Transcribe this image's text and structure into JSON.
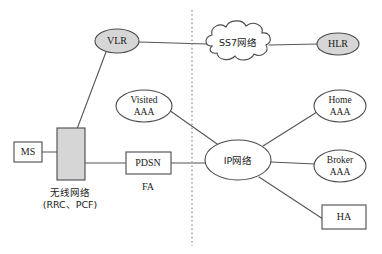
{
  "diagram": {
    "divider": {
      "name": "vertical-dotted-divider",
      "x": 192,
      "y1": 10,
      "y2": 246
    },
    "colors": {
      "gray_fill": "#d6d6d6",
      "white_fill": "#ffffff",
      "outline": "#4a4a50",
      "edge": "#55555a",
      "divider": "#a8a8ac",
      "text": "#1a1a1a",
      "background": "#ffffff"
    },
    "nodes": [
      {
        "id": "vlr",
        "label": "VLR",
        "shape": "ellipse",
        "fill": "gray",
        "cx": 117,
        "cy": 41,
        "rx": 22,
        "ry": 12
      },
      {
        "id": "ss7",
        "label": "SS7网络",
        "shape": "cloud",
        "fill": "white",
        "cx": 237,
        "cy": 44,
        "rx": 35,
        "ry": 17
      },
      {
        "id": "hlr",
        "label": "HLR",
        "shape": "ellipse",
        "fill": "gray",
        "cx": 338,
        "cy": 44,
        "rx": 21,
        "ry": 11
      },
      {
        "id": "visited",
        "label_line1": "Visited",
        "label_line2": "AAA",
        "shape": "ellipse",
        "fill": "white",
        "cx": 144,
        "cy": 106,
        "rx": 28,
        "ry": 16
      },
      {
        "id": "ip",
        "label": "IP网络",
        "shape": "ellipse",
        "fill": "white",
        "cx": 238,
        "cy": 160,
        "rx": 33,
        "ry": 20
      },
      {
        "id": "home",
        "label_line1": "Home",
        "label_line2": "AAA",
        "shape": "ellipse",
        "fill": "white",
        "cx": 340,
        "cy": 106,
        "rx": 26,
        "ry": 16
      },
      {
        "id": "broker",
        "label_line1": "Broker",
        "label_line2": "AAA",
        "shape": "ellipse",
        "fill": "white",
        "cx": 340,
        "cy": 166,
        "rx": 26,
        "ry": 16
      },
      {
        "id": "ha",
        "label": "HA",
        "shape": "rect",
        "fill": "white",
        "x": 322,
        "y": 205,
        "w": 44,
        "h": 24
      },
      {
        "id": "ms",
        "label": "MS",
        "shape": "rect",
        "fill": "white",
        "x": 14,
        "y": 142,
        "w": 28,
        "h": 20
      },
      {
        "id": "radio",
        "label": "",
        "shape": "rect",
        "fill": "gray",
        "x": 57,
        "y": 128,
        "w": 28,
        "h": 52
      },
      {
        "id": "pdsn",
        "label": "PDSN",
        "shape": "rect",
        "fill": "white",
        "x": 126,
        "y": 152,
        "w": 45,
        "h": 22
      }
    ],
    "captions": [
      {
        "id": "radio-caption-line1",
        "text": "无线网络",
        "x": 70,
        "y": 193
      },
      {
        "id": "radio-caption-line2",
        "text": "(RRC、PCF)",
        "x": 70,
        "y": 206
      },
      {
        "id": "pdsn-caption",
        "text": "FA",
        "x": 148,
        "y": 187
      }
    ],
    "edges": [
      {
        "id": "ms-radio",
        "from": "MS",
        "to": "无线网络",
        "x1": 42,
        "y1": 152,
        "x2": 57,
        "y2": 152
      },
      {
        "id": "radio-vlr",
        "from": "无线网络",
        "to": "VLR",
        "x1": 76,
        "y1": 128,
        "x2": 107,
        "y2": 52
      },
      {
        "id": "radio-pdsn",
        "from": "无线网络",
        "to": "PDSN",
        "x1": 85,
        "y1": 163,
        "x2": 126,
        "y2": 163
      },
      {
        "id": "vlr-ss7",
        "from": "VLR",
        "to": "SS7网络",
        "x1": 139,
        "y1": 42,
        "x2": 205,
        "y2": 44
      },
      {
        "id": "ss7-hlr",
        "from": "SS7网络",
        "to": "HLR",
        "x1": 270,
        "y1": 44,
        "x2": 317,
        "y2": 44
      },
      {
        "id": "visited-ip",
        "from": "Visited AAA",
        "to": "IP网络",
        "x1": 170,
        "y1": 111,
        "x2": 221,
        "y2": 146
      },
      {
        "id": "pdsn-ip",
        "from": "PDSN",
        "to": "IP网络",
        "x1": 171,
        "y1": 163,
        "x2": 205,
        "y2": 163
      },
      {
        "id": "ip-home",
        "from": "IP网络",
        "to": "Home AAA",
        "x1": 262,
        "y1": 146,
        "x2": 316,
        "y2": 112
      },
      {
        "id": "ip-broker",
        "from": "IP网络",
        "to": "Broker AAA",
        "x1": 271,
        "y1": 162,
        "x2": 314,
        "y2": 164
      },
      {
        "id": "ip-ha",
        "from": "IP网络",
        "to": "HA",
        "x1": 258,
        "y1": 177,
        "x2": 322,
        "y2": 219
      }
    ]
  }
}
